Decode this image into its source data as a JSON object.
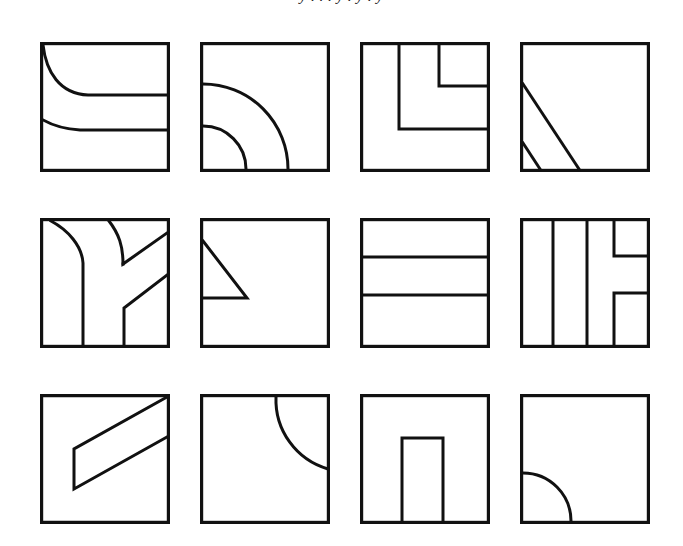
{
  "page": {
    "background_color": "#ffffff",
    "stroke_color": "#111111",
    "width": 683,
    "height": 546,
    "clipped_top_text": "y . . . y . y . y"
  },
  "grid": {
    "rows": 3,
    "columns": 4,
    "cell_count": 12,
    "square_size": 130,
    "column_x": [
      40,
      200,
      360,
      520
    ],
    "row_y": [
      42,
      218,
      394
    ]
  },
  "figures": [
    {
      "index": 1,
      "position": "row-1-col-1",
      "name": "two-decaying-curves",
      "description": "Square frame containing two curves that each descend from the left and flatten into horizontal lines running to the right edge."
    },
    {
      "index": 2,
      "position": "row-1-col-2",
      "name": "concentric-quarter-arcs-bottom-left",
      "description": "Square frame with two concentric quarter-circle arcs centered on the bottom-left corner."
    },
    {
      "index": 3,
      "position": "row-1-col-3",
      "name": "nested-L-corners",
      "description": "Square frame with two nested L-shaped right-angle paths opening toward the right edge."
    },
    {
      "index": 4,
      "position": "row-1-col-4",
      "name": "parallel-diagonals-lower-left",
      "description": "Square frame with a long diagonal from the left edge to the bottom edge and a short parallel diagonal near the bottom-left corner."
    },
    {
      "index": 5,
      "position": "row-2-col-1",
      "name": "branching-curves-and-chevrons",
      "description": "Square frame with a curve bending into a vertical line, a second curve forming a chevron toward the top-right, and a diagonal turning into a vertical line at the bottom."
    },
    {
      "index": 6,
      "position": "row-2-col-2",
      "name": "right-triangle-upper-left",
      "description": "Square frame with a right triangle formed by the left edge, a diagonal, and a horizontal line."
    },
    {
      "index": 7,
      "position": "row-2-col-3",
      "name": "three-horizontal-bands",
      "description": "Square frame divided by two horizontal lines into three stacked bands."
    },
    {
      "index": 8,
      "position": "row-2-col-4",
      "name": "vertical-bars-with-bracket",
      "description": "Square frame with two full-height vertical lines and a bracket shape opening to the right edge."
    },
    {
      "index": 9,
      "position": "row-3-col-1",
      "name": "diagonal-band-parallelogram",
      "description": "Square frame with a diagonal band running from the top-right corner down to the left of center, closed by a short vertical segment."
    },
    {
      "index": 10,
      "position": "row-3-col-2",
      "name": "quarter-arc-top-right",
      "description": "Square frame with a single quarter-circle arc centered on the top-right corner."
    },
    {
      "index": 11,
      "position": "row-3-col-3",
      "name": "inverted-u-rectangle",
      "description": "Square frame with a tall rectangle open at the bottom, centered horizontally."
    },
    {
      "index": 12,
      "position": "row-3-col-4",
      "name": "quarter-arc-bottom-left",
      "description": "Square frame with a single quarter-circle arc centered on the bottom-left corner."
    }
  ]
}
